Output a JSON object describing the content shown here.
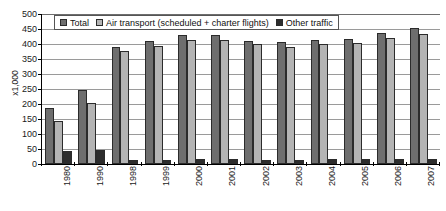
{
  "chart_data": {
    "type": "bar",
    "title": "",
    "subtitle": "",
    "xlabel": "",
    "ylabel": "x1,000",
    "ylim": [
      0,
      500
    ],
    "ytick_step": 50,
    "yticks": [
      "0",
      "50",
      "100",
      "150",
      "200",
      "250",
      "300",
      "350",
      "400",
      "450",
      "500"
    ],
    "grid": true,
    "legend_position": "top-left-inside",
    "categories": [
      "1980",
      "1990",
      "1998",
      "1999",
      "2000",
      "2001",
      "2002",
      "2003",
      "2004",
      "2005",
      "2006",
      "2007"
    ],
    "series": [
      {
        "name": "Total",
        "color": "#6e6e6e",
        "values": [
          187,
          247,
          391,
          409,
          431,
          430,
          411,
          407,
          415,
          418,
          438,
          452
        ]
      },
      {
        "name": "Air transport (scheduled + charter flights)",
        "color": "#b4b4b4",
        "values": [
          145,
          202,
          377,
          392,
          414,
          413,
          399,
          391,
          399,
          402,
          421,
          433
        ]
      },
      {
        "name": "Other traffic",
        "color": "#2d2d2d",
        "values": [
          42,
          46,
          15,
          15,
          17,
          17,
          14,
          15,
          16,
          16,
          17,
          18
        ]
      }
    ]
  }
}
